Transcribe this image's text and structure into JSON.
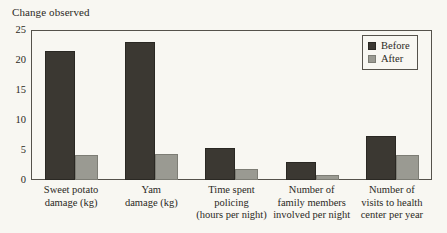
{
  "chart_data": {
    "type": "bar",
    "title": "Change observed",
    "xlabel": "",
    "ylabel": "",
    "ylim": [
      0,
      25
    ],
    "yticks": [
      0,
      5,
      10,
      15,
      20,
      25
    ],
    "grid": false,
    "legend_position": "top-right",
    "categories": [
      "Sweet potato damage (kg)",
      "Yam damage (kg)",
      "Time spent policing (hours per night)",
      "Number of family members involved per night",
      "Number of visits to health center per year"
    ],
    "category_lines": [
      [
        "Sweet potato",
        "damage (kg)"
      ],
      [
        "Yam",
        "damage (kg)"
      ],
      [
        "Time spent",
        "policing",
        "(hours per night)"
      ],
      [
        "Number of",
        "family members",
        "involved per night"
      ],
      [
        "Number of",
        "visits to health",
        "center per year"
      ]
    ],
    "series": [
      {
        "name": "Before",
        "color": "#3b3832",
        "values": [
          21.5,
          23.0,
          5.4,
          3.0,
          7.3
        ]
      },
      {
        "name": "After",
        "color": "#9a9a92",
        "values": [
          4.2,
          4.4,
          1.8,
          0.8,
          4.1
        ]
      }
    ]
  },
  "legend": {
    "items": [
      {
        "label": "Before"
      },
      {
        "label": "After"
      }
    ]
  },
  "colors": {
    "background": "#f8f7f2",
    "axis": "#55524b",
    "before": "#3b3832",
    "after": "#9a9a92"
  }
}
